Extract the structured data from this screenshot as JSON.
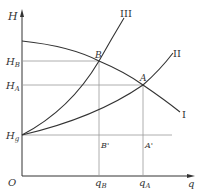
{
  "axes": {
    "y_label": "H",
    "x_label": "q",
    "origin": "O"
  },
  "y_ticks": {
    "hb": "H",
    "hb_sub": "B",
    "ha": "H",
    "ha_sub": "A",
    "hg": "H",
    "hg_sub": "g"
  },
  "x_ticks": {
    "qb": "q",
    "qb_sub": "B",
    "qa": "q",
    "qa_sub": "A"
  },
  "points": {
    "b": "B",
    "a": "A",
    "bp": "B'",
    "ap": "A'"
  },
  "curves": {
    "c1": "I",
    "c2": "II",
    "c3": "III"
  }
}
